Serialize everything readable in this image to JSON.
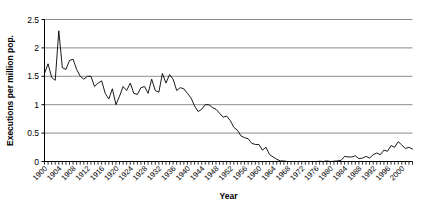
{
  "chart_data": {
    "type": "line",
    "title": "",
    "xlabel": "Year",
    "ylabel": "Executions per million pop.",
    "ylim": [
      0,
      2.5
    ],
    "xlim": [
      1900,
      2003
    ],
    "grid": true,
    "legend_position": "none",
    "ytick_labels": [
      "0",
      "0.5",
      "1",
      "1.5",
      "2",
      "2.5"
    ],
    "ytick_values": [
      0,
      0.5,
      1,
      1.5,
      2,
      2.5
    ],
    "xtick_labels": [
      "1900",
      "1904",
      "1908",
      "1912",
      "1916",
      "1920",
      "1924",
      "1928",
      "1932",
      "1936",
      "1940",
      "1944",
      "1948",
      "1952",
      "1956",
      "1960",
      "1964",
      "1968",
      "1972",
      "1976",
      "1980",
      "1984",
      "1988",
      "1992",
      "1996",
      "2000"
    ],
    "xtick_values": [
      1900,
      1904,
      1908,
      1912,
      1916,
      1920,
      1924,
      1928,
      1932,
      1936,
      1940,
      1944,
      1948,
      1952,
      1956,
      1960,
      1964,
      1968,
      1972,
      1976,
      1980,
      1984,
      1988,
      1992,
      1996,
      2000
    ],
    "line_color": "#000000",
    "grid_color": "#808080",
    "x": [
      1900,
      1901,
      1902,
      1903,
      1904,
      1905,
      1906,
      1907,
      1908,
      1909,
      1910,
      1911,
      1912,
      1913,
      1914,
      1915,
      1916,
      1917,
      1918,
      1919,
      1920,
      1921,
      1922,
      1923,
      1924,
      1925,
      1926,
      1927,
      1928,
      1929,
      1930,
      1931,
      1932,
      1933,
      1934,
      1935,
      1936,
      1937,
      1938,
      1939,
      1940,
      1941,
      1942,
      1943,
      1944,
      1945,
      1946,
      1947,
      1948,
      1949,
      1950,
      1951,
      1952,
      1953,
      1954,
      1955,
      1956,
      1957,
      1958,
      1959,
      1960,
      1961,
      1962,
      1963,
      1964,
      1965,
      1966,
      1967,
      1968,
      1969,
      1970,
      1971,
      1972,
      1973,
      1974,
      1975,
      1976,
      1977,
      1978,
      1979,
      1980,
      1981,
      1982,
      1983,
      1984,
      1985,
      1986,
      1987,
      1988,
      1989,
      1990,
      1991,
      1992,
      1993,
      1994,
      1995,
      1996,
      1997,
      1998,
      1999,
      2000,
      2001,
      2002,
      2003
    ],
    "values": [
      1.55,
      1.72,
      1.48,
      1.43,
      2.3,
      1.65,
      1.62,
      1.78,
      1.8,
      1.62,
      1.5,
      1.45,
      1.5,
      1.5,
      1.32,
      1.38,
      1.42,
      1.2,
      1.1,
      1.28,
      1.0,
      1.15,
      1.32,
      1.25,
      1.38,
      1.2,
      1.18,
      1.3,
      1.32,
      1.2,
      1.45,
      1.25,
      1.22,
      1.55,
      1.38,
      1.53,
      1.45,
      1.25,
      1.3,
      1.28,
      1.2,
      1.12,
      0.98,
      0.88,
      0.92,
      1.0,
      1.0,
      0.95,
      0.92,
      0.85,
      0.78,
      0.8,
      0.72,
      0.6,
      0.55,
      0.45,
      0.42,
      0.4,
      0.32,
      0.3,
      0.3,
      0.2,
      0.25,
      0.12,
      0.08,
      0.04,
      0.01,
      0.01,
      0.0,
      0.0,
      0.0,
      0.0,
      0.0,
      0.0,
      0.0,
      0.0,
      0.0,
      0.005,
      0.0,
      0.01,
      0.0,
      0.005,
      0.01,
      0.02,
      0.09,
      0.08,
      0.08,
      0.1,
      0.05,
      0.06,
      0.09,
      0.06,
      0.12,
      0.15,
      0.12,
      0.2,
      0.18,
      0.28,
      0.25,
      0.35,
      0.29,
      0.23,
      0.25,
      0.22
    ]
  }
}
